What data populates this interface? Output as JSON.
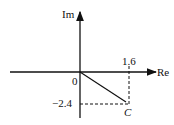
{
  "diagram": {
    "type": "complex-plane",
    "axes": {
      "x_label": "Re",
      "y_label": "Im",
      "origin_label": "0"
    },
    "point": {
      "label": "C",
      "re": 1.6,
      "im": -2.4
    },
    "ticks": {
      "re_value": "1.6",
      "im_value": "−2.4"
    },
    "colors": {
      "ink": "#111111",
      "background": "#ffffff"
    }
  }
}
